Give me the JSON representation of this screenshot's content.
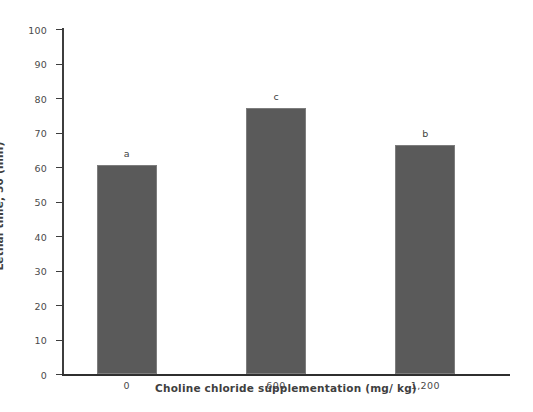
{
  "chart_data": {
    "type": "bar",
    "title": "",
    "subtitle": "",
    "xlabel": "Choline chloride supplementation (mg/ kg)",
    "ylabel": "Lethal time, 50 (min)",
    "categories": [
      "0",
      "600",
      "1,200"
    ],
    "values": [
      60.5,
      77.0,
      66.5
    ],
    "annotations": [
      "a",
      "c",
      "b"
    ],
    "ylim": [
      0,
      100
    ],
    "ytick_step": 10,
    "yticks": [
      0,
      10,
      20,
      30,
      40,
      50,
      60,
      70,
      80,
      90,
      100
    ],
    "ytick_labels": [
      "0",
      "10",
      "20",
      "30",
      "40",
      "50",
      "60",
      "70",
      "80",
      "90",
      "100"
    ],
    "grid": false,
    "legend": false,
    "legend_position": "none",
    "bar_color": "#5a5a5a",
    "bar_edge_color": "#7d7d7d",
    "axis_color": "#3d3d3d",
    "text_color": "#3f3f3f"
  }
}
